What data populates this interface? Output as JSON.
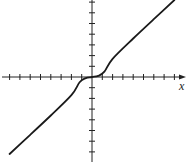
{
  "chart_data": {
    "type": "line",
    "title": "",
    "xlabel": "x",
    "ylabel": "",
    "grid": false,
    "legend": null,
    "x_ticks_unlabeled": [
      -8,
      -7,
      -6,
      -5,
      -4,
      -3,
      -2,
      -1,
      1,
      2,
      3,
      4,
      5,
      6,
      7,
      8
    ],
    "y_ticks_unlabeled": [
      -7,
      -6,
      -5,
      -4,
      -3,
      -2,
      -1,
      1,
      2,
      3,
      4,
      5,
      6,
      7
    ],
    "xlim": [
      -9,
      9
    ],
    "ylim": [
      -8,
      7.2
    ],
    "series": [
      {
        "name": "f(x)",
        "description": "Odd function, approximately linear with slope ~1 away from origin, flattening to horizontal tangent at the origin (cubic-like near 0)",
        "x": [
          -8,
          -6,
          -4,
          -2,
          -1.2,
          -0.6,
          0,
          0.6,
          1.2,
          2,
          4,
          6,
          8
        ],
        "y": [
          -7.2,
          -5.4,
          -3.6,
          -1.7,
          -0.5,
          -0.1,
          0,
          0.1,
          0.5,
          1.7,
          3.6,
          5.4,
          7.2
        ]
      }
    ]
  },
  "axes": {
    "x_label": "x",
    "color": "#222222",
    "curve_color": "#1a1a1a"
  }
}
